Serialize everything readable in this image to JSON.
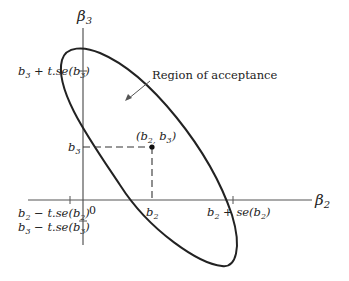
{
  "diagram": {
    "type": "confidence-ellipse",
    "axes": {
      "x_label": "β",
      "x_sub": "2",
      "y_label": "β",
      "y_sub": "3",
      "origin_label": "0"
    },
    "point": {
      "label": "(b2, b3)",
      "text_open": "(b",
      "sub1": "2,",
      "mid": " b",
      "sub2": "3",
      "text_close": ")"
    },
    "annotation": {
      "text": "Region of acceptance"
    },
    "ticks": {
      "y_upper": {
        "b": "b",
        "sub": "3",
        "rest": " + t.se(b",
        "sub2": "3",
        "close": ")"
      },
      "y_point": {
        "b": "b",
        "sub": "3"
      },
      "y_lower": {
        "b": "b",
        "sub": "3",
        "rest": " − t.se(b",
        "sub2": "3",
        "close": ")"
      },
      "x_lower": {
        "b": "b",
        "sub": "2",
        "rest": " − t.se(b",
        "sub2": "2",
        "close": ")"
      },
      "x_point": {
        "b": "b",
        "sub": "2"
      },
      "x_upper": {
        "b": "b",
        "sub": "2",
        "rest": " + se(b",
        "sub2": "2",
        "close": ")"
      }
    },
    "colors": {
      "ink": "#222222",
      "axis": "#555555"
    }
  }
}
